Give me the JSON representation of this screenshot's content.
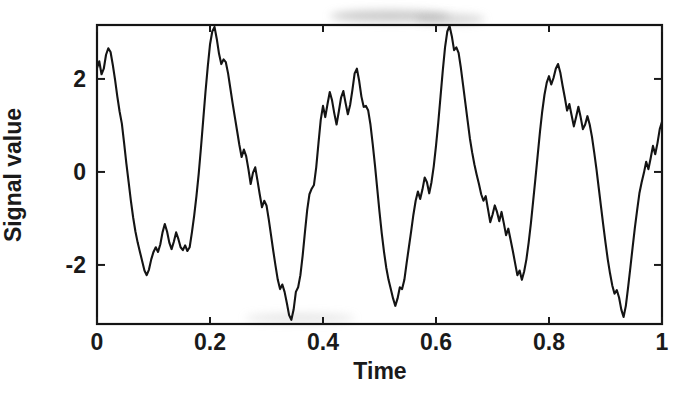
{
  "chart_data": {
    "type": "line",
    "title": "",
    "subtitle": "",
    "xlabel": "Time",
    "ylabel": "Signal value",
    "xlim": [
      0,
      1
    ],
    "ylim": [
      -3.27,
      3.16
    ],
    "xticks": [
      0,
      0.2,
      0.4,
      0.6,
      0.8,
      1
    ],
    "xtick_labels": [
      "0",
      "0.2",
      "0.4",
      "0.6",
      "0.8",
      "1"
    ],
    "yticks": [
      -2,
      0,
      2
    ],
    "ytick_labels": [
      "-2",
      "0",
      "2"
    ],
    "grid": false,
    "legend": null,
    "legend_position": "none",
    "line_color": "#141414",
    "line_width": 2.1,
    "background_color": "#ffffff",
    "frame": true,
    "annotations": [],
    "series": [
      {
        "name": "signal",
        "x": [
          0.0,
          0.004,
          0.008,
          0.012,
          0.016,
          0.02,
          0.024,
          0.028,
          0.032,
          0.036,
          0.04,
          0.044,
          0.048,
          0.052,
          0.056,
          0.06,
          0.064,
          0.068,
          0.072,
          0.076,
          0.08,
          0.084,
          0.088,
          0.092,
          0.096,
          0.1,
          0.104,
          0.108,
          0.112,
          0.116,
          0.12,
          0.124,
          0.128,
          0.132,
          0.136,
          0.14,
          0.144,
          0.148,
          0.152,
          0.156,
          0.16,
          0.164,
          0.168,
          0.172,
          0.176,
          0.18,
          0.184,
          0.188,
          0.192,
          0.196,
          0.2,
          0.204,
          0.208,
          0.212,
          0.216,
          0.22,
          0.224,
          0.228,
          0.232,
          0.236,
          0.24,
          0.244,
          0.248,
          0.252,
          0.256,
          0.26,
          0.264,
          0.268,
          0.272,
          0.276,
          0.28,
          0.284,
          0.288,
          0.292,
          0.296,
          0.3,
          0.304,
          0.308,
          0.312,
          0.316,
          0.32,
          0.324,
          0.328,
          0.332,
          0.336,
          0.34,
          0.344,
          0.348,
          0.352,
          0.356,
          0.36,
          0.364,
          0.368,
          0.372,
          0.376,
          0.38,
          0.384,
          0.388,
          0.392,
          0.396,
          0.4,
          0.404,
          0.408,
          0.412,
          0.416,
          0.42,
          0.424,
          0.428,
          0.432,
          0.436,
          0.44,
          0.444,
          0.448,
          0.452,
          0.456,
          0.46,
          0.464,
          0.468,
          0.472,
          0.476,
          0.48,
          0.484,
          0.488,
          0.492,
          0.496,
          0.5,
          0.504,
          0.508,
          0.512,
          0.516,
          0.52,
          0.524,
          0.528,
          0.532,
          0.536,
          0.54,
          0.544,
          0.548,
          0.552,
          0.556,
          0.56,
          0.564,
          0.568,
          0.572,
          0.576,
          0.58,
          0.584,
          0.588,
          0.592,
          0.596,
          0.6,
          0.604,
          0.608,
          0.612,
          0.616,
          0.62,
          0.624,
          0.628,
          0.632,
          0.636,
          0.64,
          0.644,
          0.648,
          0.652,
          0.656,
          0.66,
          0.664,
          0.668,
          0.672,
          0.676,
          0.68,
          0.684,
          0.688,
          0.692,
          0.696,
          0.7,
          0.704,
          0.708,
          0.712,
          0.716,
          0.72,
          0.724,
          0.728,
          0.732,
          0.736,
          0.74,
          0.744,
          0.748,
          0.752,
          0.756,
          0.76,
          0.764,
          0.768,
          0.772,
          0.776,
          0.78,
          0.784,
          0.788,
          0.792,
          0.796,
          0.8,
          0.804,
          0.808,
          0.812,
          0.816,
          0.82,
          0.824,
          0.828,
          0.832,
          0.836,
          0.84,
          0.844,
          0.848,
          0.852,
          0.856,
          0.86,
          0.864,
          0.868,
          0.872,
          0.876,
          0.88,
          0.884,
          0.888,
          0.892,
          0.896,
          0.9,
          0.904,
          0.908,
          0.912,
          0.916,
          0.92,
          0.924,
          0.928,
          0.932,
          0.936,
          0.94,
          0.944,
          0.948,
          0.952,
          0.956,
          0.96,
          0.964,
          0.968,
          0.972,
          0.976,
          0.98,
          0.984,
          0.988,
          0.992,
          0.996,
          1.0
        ],
        "y": [
          2.23,
          2.38,
          2.1,
          2.22,
          2.52,
          2.66,
          2.58,
          2.3,
          1.98,
          1.62,
          1.3,
          1.04,
          0.62,
          0.18,
          -0.22,
          -0.62,
          -0.98,
          -1.28,
          -1.52,
          -1.72,
          -1.92,
          -2.12,
          -2.22,
          -2.1,
          -1.88,
          -1.72,
          -1.62,
          -1.72,
          -1.56,
          -1.3,
          -1.12,
          -1.28,
          -1.52,
          -1.66,
          -1.5,
          -1.3,
          -1.44,
          -1.62,
          -1.68,
          -1.58,
          -1.7,
          -1.62,
          -1.3,
          -0.94,
          -0.52,
          -0.04,
          0.52,
          1.12,
          1.72,
          2.26,
          2.74,
          3.02,
          3.12,
          2.86,
          2.54,
          2.32,
          2.42,
          2.36,
          2.12,
          1.8,
          1.48,
          1.18,
          0.88,
          0.58,
          0.32,
          0.48,
          0.34,
          0.06,
          -0.26,
          -0.02,
          0.1,
          -0.18,
          -0.48,
          -0.76,
          -0.62,
          -0.72,
          -1.02,
          -1.36,
          -1.7,
          -2.02,
          -2.32,
          -2.52,
          -2.42,
          -2.58,
          -2.82,
          -3.08,
          -3.18,
          -2.96,
          -2.58,
          -2.48,
          -2.22,
          -1.8,
          -1.3,
          -0.82,
          -0.48,
          -0.36,
          -0.28,
          0.1,
          0.62,
          1.12,
          1.42,
          1.18,
          1.46,
          1.72,
          1.54,
          1.26,
          1.02,
          1.3,
          1.6,
          1.74,
          1.48,
          1.24,
          1.44,
          1.76,
          2.12,
          2.22,
          1.96,
          1.62,
          1.4,
          1.42,
          1.32,
          1.02,
          0.6,
          0.14,
          -0.36,
          -0.86,
          -1.32,
          -1.72,
          -2.06,
          -2.32,
          -2.52,
          -2.72,
          -2.88,
          -2.72,
          -2.48,
          -2.52,
          -2.32,
          -1.96,
          -1.62,
          -1.28,
          -0.92,
          -0.62,
          -0.42,
          -0.58,
          -0.38,
          -0.12,
          -0.22,
          -0.46,
          -0.22,
          0.12,
          0.56,
          1.06,
          1.62,
          2.18,
          2.68,
          3.02,
          3.14,
          2.92,
          2.62,
          2.68,
          2.56,
          2.24,
          1.86,
          1.48,
          1.1,
          0.72,
          0.42,
          0.16,
          -0.06,
          -0.26,
          -0.48,
          -0.62,
          -0.52,
          -0.8,
          -1.08,
          -0.92,
          -0.72,
          -0.86,
          -1.06,
          -0.86,
          -1.1,
          -1.36,
          -1.22,
          -1.46,
          -1.7,
          -1.96,
          -2.22,
          -2.12,
          -2.32,
          -2.14,
          -1.88,
          -1.52,
          -1.1,
          -0.62,
          -0.14,
          0.36,
          0.86,
          1.3,
          1.66,
          1.92,
          2.06,
          1.88,
          2.02,
          2.22,
          2.32,
          2.14,
          1.86,
          1.6,
          1.32,
          1.46,
          1.22,
          0.98,
          1.18,
          1.4,
          1.18,
          0.92,
          1.02,
          1.2,
          1.02,
          0.76,
          0.42,
          0.06,
          -0.34,
          -0.74,
          -1.14,
          -1.52,
          -1.88,
          -2.18,
          -2.44,
          -2.62,
          -2.54,
          -2.7,
          -2.96,
          -3.12,
          -2.88,
          -2.48,
          -2.06,
          -1.62,
          -1.2,
          -0.82,
          -0.46,
          -0.22,
          -0.02,
          0.22,
          0.06,
          0.3,
          0.56,
          0.38,
          0.62,
          0.92,
          1.08
        ]
      }
    ]
  },
  "axes": {
    "xlabel": "Time",
    "ylabel": "Signal value",
    "xtick_labels": [
      "0",
      "0.2",
      "0.4",
      "0.6",
      "0.8",
      "1"
    ],
    "ytick_labels": [
      "2",
      "0",
      "-2"
    ]
  }
}
